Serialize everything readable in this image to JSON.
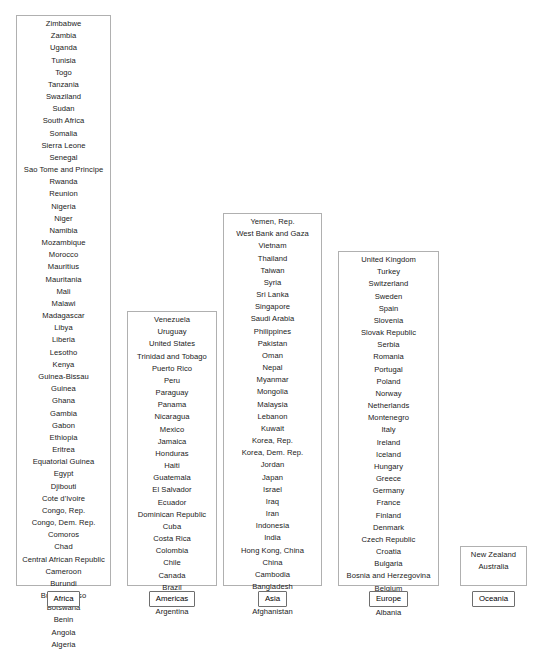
{
  "chart_data": {
    "type": "table",
    "title": "",
    "xlabel": "",
    "ylabel": "",
    "legend_position": "bottom",
    "grid": false,
    "categories": [
      "Africa",
      "Americas",
      "Asia",
      "Europe",
      "Oceania"
    ],
    "values": [
      46,
      23,
      31,
      30,
      2
    ]
  },
  "regions": [
    {
      "label": "Africa",
      "count": 46,
      "countries": [
        "Zimbabwe",
        "Zambia",
        "Uganda",
        "Tunisia",
        "Togo",
        "Tanzania",
        "Swaziland",
        "Sudan",
        "South Africa",
        "Somalia",
        "Sierra Leone",
        "Senegal",
        "Sao Tome and Principe",
        "Rwanda",
        "Reunion",
        "Nigeria",
        "Niger",
        "Namibia",
        "Mozambique",
        "Morocco",
        "Mauritius",
        "Mauritania",
        "Mali",
        "Malawi",
        "Madagascar",
        "Libya",
        "Liberia",
        "Lesotho",
        "Kenya",
        "Guinea-Bissau",
        "Guinea",
        "Ghana",
        "Gambia",
        "Gabon",
        "Ethiopia",
        "Eritrea",
        "Equatorial Guinea",
        "Egypt",
        "Djibouti",
        "Cote d'Ivoire",
        "Congo, Rep.",
        "Congo, Dem. Rep.",
        "Comoros",
        "Chad",
        "Central African Republic",
        "Cameroon",
        "Burundi",
        "Burkina Faso",
        "Botswana",
        "Benin",
        "Angola",
        "Algeria"
      ]
    },
    {
      "label": "Americas",
      "count": 23,
      "countries": [
        "Venezuela",
        "Uruguay",
        "United States",
        "Trinidad and Tobago",
        "Puerto Rico",
        "Peru",
        "Paraguay",
        "Panama",
        "Nicaragua",
        "Mexico",
        "Jamaica",
        "Honduras",
        "Haiti",
        "Guatemala",
        "El Salvador",
        "Ecuador",
        "Dominican Republic",
        "Cuba",
        "Costa Rica",
        "Colombia",
        "Chile",
        "Canada",
        "Brazil",
        "Bolivia",
        "Argentina"
      ]
    },
    {
      "label": "Asia",
      "count": 31,
      "countries": [
        "Yemen, Rep.",
        "West Bank and Gaza",
        "Vietnam",
        "Thailand",
        "Taiwan",
        "Syria",
        "Sri Lanka",
        "Singapore",
        "Saudi Arabia",
        "Philippines",
        "Pakistan",
        "Oman",
        "Nepal",
        "Myanmar",
        "Mongolia",
        "Malaysia",
        "Lebanon",
        "Kuwait",
        "Korea, Rep.",
        "Korea, Dem. Rep.",
        "Jordan",
        "Japan",
        "Israel",
        "Iraq",
        "Iran",
        "Indonesia",
        "India",
        "Hong Kong, China",
        "China",
        "Cambodia",
        "Bangladesh",
        "Bahrain",
        "Afghanistan"
      ]
    },
    {
      "label": "Europe",
      "count": 30,
      "countries": [
        "United Kingdom",
        "Turkey",
        "Switzerland",
        "Sweden",
        "Spain",
        "Slovenia",
        "Slovak Republic",
        "Serbia",
        "Romania",
        "Portugal",
        "Poland",
        "Norway",
        "Netherlands",
        "Montenegro",
        "Italy",
        "Ireland",
        "Iceland",
        "Hungary",
        "Greece",
        "Germany",
        "France",
        "Finland",
        "Denmark",
        "Czech Republic",
        "Croatia",
        "Bulgaria",
        "Bosnia and Herzegovina",
        "Belgium",
        "Austria",
        "Albania"
      ]
    },
    {
      "label": "Oceania",
      "count": 2,
      "countries": [
        "New Zealand",
        "Australia"
      ]
    }
  ],
  "colors": {
    "background": "#ffffff",
    "text": "#1a1a1a",
    "box_border": "#b0b0b0",
    "label_border": "#6e6e6e"
  }
}
